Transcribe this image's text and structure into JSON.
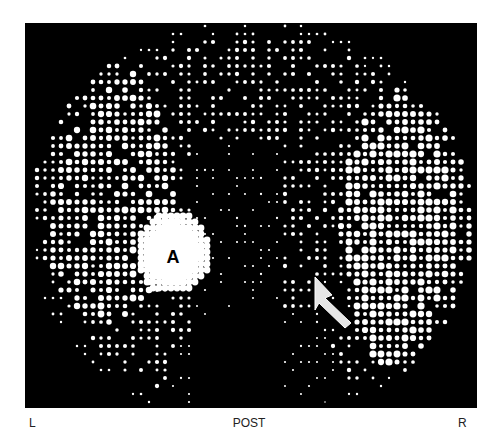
{
  "figure": {
    "type": "radionuclide liver-spleen scan (dot-matrix scintigram)",
    "view": "POST",
    "orientation": {
      "left": "L",
      "right": "R"
    },
    "annotations": [
      {
        "label": "A",
        "description": "focal area of increased uptake (hot spot)"
      },
      {
        "label": "arrow",
        "description": "arrow pointing to a region in the right-side organ"
      }
    ],
    "colors": {
      "background": "#000000",
      "dots": "#ffffff",
      "label_text": "#222222",
      "page": "#ffffff"
    }
  }
}
